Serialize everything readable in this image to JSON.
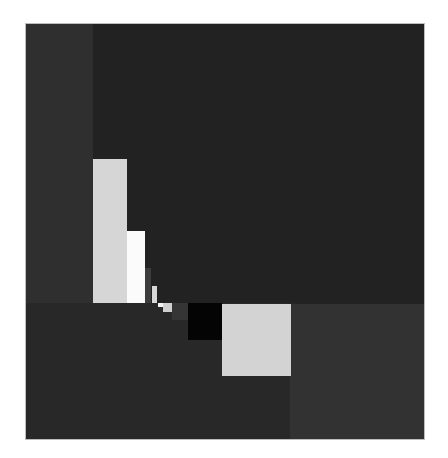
{
  "artwork": {
    "description": "Abstract geometric composition of grey, white and black rectangles on a dark ground",
    "colors": {
      "frame": "#ffffff",
      "left_column": "#2f2f2f",
      "top_right_field": "#222222",
      "bottom_left_field": "#282828",
      "bottom_right_field": "#323232",
      "light_grey": "#d4d4d4",
      "white": "#fafafa",
      "mid_grey": "#3a3a3a",
      "black": "#050505"
    },
    "blocks": [
      {
        "name": "left-column",
        "x": 26,
        "y": 24,
        "w": 67,
        "h": 279,
        "color": "#2f2f2f"
      },
      {
        "name": "top-right-field",
        "x": 93,
        "y": 24,
        "w": 331,
        "h": 279,
        "color": "#222222"
      },
      {
        "name": "bottom-left-field",
        "x": 26,
        "y": 303,
        "w": 264,
        "h": 136,
        "color": "#282828"
      },
      {
        "name": "bottom-right-field",
        "x": 290,
        "y": 304,
        "w": 134,
        "h": 135,
        "color": "#323232"
      },
      {
        "name": "tall-light-grey-rect",
        "x": 93,
        "y": 159,
        "w": 34,
        "h": 144,
        "color": "#d6d6d6"
      },
      {
        "name": "white-rect",
        "x": 127,
        "y": 231,
        "w": 18,
        "h": 72,
        "color": "#fbfbfb"
      },
      {
        "name": "grey-strip",
        "x": 145,
        "y": 268,
        "w": 6,
        "h": 35,
        "color": "#3c3c3c"
      },
      {
        "name": "small-light-bar",
        "x": 152,
        "y": 286,
        "w": 5,
        "h": 17,
        "color": "#d8d8d8"
      },
      {
        "name": "tiny-white-square",
        "x": 158,
        "y": 303,
        "w": 5,
        "h": 4,
        "color": "#f5f5f5"
      },
      {
        "name": "small-light-square",
        "x": 163,
        "y": 303,
        "w": 9,
        "h": 9,
        "color": "#d0d0d0"
      },
      {
        "name": "mid-grey-square",
        "x": 172,
        "y": 303,
        "w": 16,
        "h": 17,
        "color": "#353535"
      },
      {
        "name": "black-square",
        "x": 188,
        "y": 303,
        "w": 34,
        "h": 37,
        "color": "#040404"
      },
      {
        "name": "large-light-square",
        "x": 222,
        "y": 304,
        "w": 69,
        "h": 72,
        "color": "#d3d3d3"
      }
    ]
  }
}
